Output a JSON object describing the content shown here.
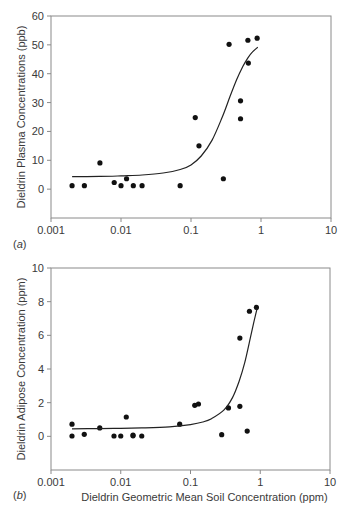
{
  "chart_data": [
    {
      "type": "scatter",
      "panel": "a",
      "panel_label": "a",
      "title": "",
      "xlabel": "",
      "ylabel": "Dieldrin Plasma Concentrations (ppb)",
      "xscale": "log",
      "xlim": [
        0.001,
        10
      ],
      "ylim": [
        -10,
        60
      ],
      "xticks": [
        0.001,
        0.01,
        0.1,
        1,
        10
      ],
      "xtick_labels": [
        "0.001",
        "0.01",
        "0.1",
        "1",
        "10"
      ],
      "yticks": [
        0,
        10,
        20,
        30,
        40,
        50,
        60
      ],
      "ytick_labels": [
        "0",
        "10",
        "20",
        "30",
        "40",
        "50",
        "60"
      ],
      "grid": false,
      "series": [
        {
          "name": "observed",
          "kind": "points",
          "x": [
            0.002,
            0.003,
            0.005,
            0.008,
            0.01,
            0.012,
            0.015,
            0.02,
            0.07,
            0.115,
            0.13,
            0.29,
            0.35,
            0.51,
            0.51,
            0.65,
            0.66,
            0.88
          ],
          "y": [
            1.2,
            1.2,
            9.1,
            2.3,
            1.2,
            3.6,
            1.2,
            1.2,
            1.2,
            24.8,
            15.0,
            3.6,
            50.2,
            30.6,
            24.4,
            51.6,
            43.7,
            52.3
          ]
        },
        {
          "name": "fitted curve",
          "kind": "line",
          "x": [
            0.002,
            0.005,
            0.01,
            0.02,
            0.04,
            0.07,
            0.1,
            0.14,
            0.2,
            0.28,
            0.36,
            0.45,
            0.55,
            0.65,
            0.75,
            0.9
          ],
          "y": [
            4.3,
            4.4,
            4.6,
            4.9,
            5.6,
            6.8,
            8.4,
            11.5,
            17.0,
            25.0,
            32.0,
            38.0,
            42.5,
            45.5,
            47.5,
            49.2
          ]
        }
      ]
    },
    {
      "type": "scatter",
      "panel": "b",
      "panel_label": "b",
      "title": "",
      "xlabel": "Dieldrin Geometric Mean Soil Concentration (ppm)",
      "ylabel": "Dieldrin Adipose Concentration (ppm)",
      "xscale": "log",
      "xlim": [
        0.001,
        10
      ],
      "ylim": [
        -2,
        10
      ],
      "xticks": [
        0.001,
        0.01,
        0.1,
        1,
        10
      ],
      "xtick_labels": [
        "0.001",
        "0.01",
        "0.1",
        "1",
        "10"
      ],
      "yticks": [
        0,
        2,
        4,
        6,
        8,
        10
      ],
      "ytick_labels": [
        "0",
        "2",
        "4",
        "6",
        "8",
        "10"
      ],
      "grid": false,
      "series": [
        {
          "name": "observed",
          "kind": "points",
          "x": [
            0.002,
            0.002,
            0.003,
            0.005,
            0.008,
            0.01,
            0.012,
            0.015,
            0.015,
            0.02,
            0.07,
            0.115,
            0.13,
            0.28,
            0.35,
            0.51,
            0.51,
            0.65,
            0.7,
            0.88
          ],
          "y": [
            0.72,
            0.02,
            0.12,
            0.5,
            0.02,
            0.02,
            1.15,
            0.08,
            0.03,
            0.02,
            0.72,
            1.84,
            1.92,
            0.1,
            1.69,
            1.78,
            5.84,
            0.31,
            7.43,
            7.66
          ]
        },
        {
          "name": "fitted curve",
          "kind": "line",
          "x": [
            0.002,
            0.005,
            0.01,
            0.02,
            0.05,
            0.1,
            0.15,
            0.2,
            0.3,
            0.4,
            0.5,
            0.6,
            0.7,
            0.8,
            0.9
          ],
          "y": [
            0.45,
            0.46,
            0.48,
            0.5,
            0.56,
            0.7,
            0.85,
            1.05,
            1.55,
            2.3,
            3.3,
            4.4,
            5.6,
            6.7,
            7.6
          ]
        }
      ]
    }
  ],
  "panels": {
    "a": {
      "label_open": "(",
      "label_letter": "a",
      "label_close": ")"
    },
    "b": {
      "label_open": "(",
      "label_letter": "b",
      "label_close": ")"
    }
  },
  "colors": {
    "axis": "#8a8a8a",
    "points": "#111111",
    "curve": "#222222",
    "text": "#3a3a3a"
  }
}
